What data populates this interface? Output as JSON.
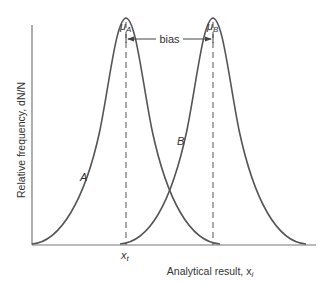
{
  "figure": {
    "y_axis_label": "Relative frequency, dN/N",
    "x_axis_label": "Analytical result, x",
    "x_axis_subscript": "i",
    "mu_a": "μ",
    "mu_a_sub": "A",
    "mu_b": "μ",
    "mu_b_sub": "B",
    "bias_label": "bias",
    "curve_a_label": "A",
    "curve_b_label": "B",
    "xt_label": "x",
    "xt_sub": "t"
  },
  "colors": {
    "curve": "#555555",
    "axis": "#777777",
    "text": "#333333"
  }
}
